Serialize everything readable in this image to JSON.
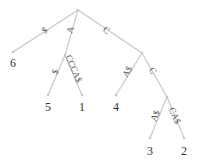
{
  "diagram": {
    "type": "suffix-tree",
    "colors": {
      "edge": "#c8c8c8",
      "label": "#555555",
      "leaf_text": "#333333"
    },
    "nodes": [
      {
        "id": "root",
        "x": 78,
        "y": 10
      },
      {
        "id": "n6",
        "x": 13,
        "y": 52,
        "label": "6"
      },
      {
        "id": "nA",
        "x": 65,
        "y": 55
      },
      {
        "id": "n5",
        "x": 48,
        "y": 95,
        "label": "5"
      },
      {
        "id": "n1",
        "x": 82,
        "y": 95,
        "label": "1"
      },
      {
        "id": "nC",
        "x": 142,
        "y": 53
      },
      {
        "id": "n4",
        "x": 116,
        "y": 95,
        "label": "4"
      },
      {
        "id": "nCC",
        "x": 167,
        "y": 97
      },
      {
        "id": "n3",
        "x": 150,
        "y": 138,
        "label": "3"
      },
      {
        "id": "n2",
        "x": 184,
        "y": 138,
        "label": "2"
      }
    ],
    "edges": [
      {
        "from": "root",
        "to": "n6",
        "label": "$"
      },
      {
        "from": "root",
        "to": "nA",
        "label": "A"
      },
      {
        "from": "nA",
        "to": "n5",
        "label": "$"
      },
      {
        "from": "nA",
        "to": "n1",
        "label": "CCCA$"
      },
      {
        "from": "root",
        "to": "nC",
        "label": "C"
      },
      {
        "from": "nC",
        "to": "n4",
        "label": "A$"
      },
      {
        "from": "nC",
        "to": "nCC",
        "label": "C"
      },
      {
        "from": "nCC",
        "to": "n3",
        "label": "A$"
      },
      {
        "from": "nCC",
        "to": "n2",
        "label": "CA$"
      }
    ]
  }
}
